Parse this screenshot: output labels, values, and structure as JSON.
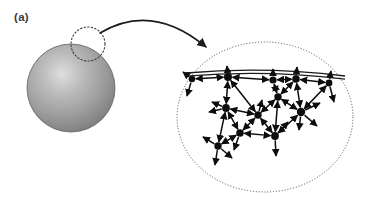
{
  "figure": {
    "panel_label": "(a)",
    "background_color": "#ffffff",
    "width": 369,
    "height": 202
  },
  "particle": {
    "name": "nanoparticle-sphere",
    "center_x": 71,
    "center_y": 88,
    "radius": 44,
    "highlight_x": 62,
    "highlight_y": 78,
    "color_center": "#d8d8d8",
    "color_mid": "#9a9a9a",
    "color_edge": "#6f6f6f",
    "outline_color": "#5e5e5e"
  },
  "callout_circle": {
    "name": "surface-region-marker",
    "center_x": 88,
    "center_y": 44,
    "radius": 17,
    "stroke_color": "#3b3b3b",
    "dash": "1.4 2.2"
  },
  "callout_arrow": {
    "name": "magnification-arrow",
    "start_x": 100,
    "start_y": 33,
    "control_x": 152,
    "control_y": 2,
    "end_x": 206,
    "end_y": 47,
    "stroke_color": "#1b1b1b",
    "stroke_width": 1.6
  },
  "magnified_view": {
    "name": "magnified-surface-ellipse",
    "center_x": 265,
    "center_y": 117,
    "radius_x": 88,
    "radius_y": 75,
    "stroke_color": "#4a4a4a",
    "dash": "1 1.9"
  },
  "surface_line": {
    "name": "crystal-surface-line",
    "x1": 186,
    "y1": 73,
    "cx": 265,
    "cy": 66,
    "x2": 345,
    "y2": 76,
    "stroke_color": "#1b1b1b",
    "stroke_width": 1.3,
    "offset": 3.2
  },
  "network": {
    "name": "atomic-interaction-network",
    "node_color": "#0d0d0d",
    "edge_color": "#0d0d0d",
    "edge_width": 1.5,
    "node_radius_default": 3.4,
    "nodes": [
      {
        "id": "n0",
        "x": 192,
        "y": 79,
        "r": 3.3
      },
      {
        "id": "n1",
        "x": 228,
        "y": 77,
        "r": 4.0
      },
      {
        "id": "n2",
        "x": 273,
        "y": 80,
        "r": 3.6
      },
      {
        "id": "n3",
        "x": 296,
        "y": 79,
        "r": 3.8
      },
      {
        "id": "n4",
        "x": 329,
        "y": 83,
        "r": 3.4
      },
      {
        "id": "n5",
        "x": 226,
        "y": 108,
        "r": 3.9
      },
      {
        "id": "n6",
        "x": 258,
        "y": 115,
        "r": 3.7
      },
      {
        "id": "n7",
        "x": 278,
        "y": 97,
        "r": 3.7
      },
      {
        "id": "n8",
        "x": 301,
        "y": 112,
        "r": 4.2
      },
      {
        "id": "n9",
        "x": 240,
        "y": 133,
        "r": 3.8
      },
      {
        "id": "n10",
        "x": 275,
        "y": 136,
        "r": 3.9
      },
      {
        "id": "n11",
        "x": 218,
        "y": 146,
        "r": 3.7
      }
    ],
    "edges": [
      {
        "from": "n0",
        "to": "n1"
      },
      {
        "from": "n1",
        "to": "n2"
      },
      {
        "from": "n2",
        "to": "n3"
      },
      {
        "from": "n3",
        "to": "n4"
      },
      {
        "from": "n1",
        "to": "n5"
      },
      {
        "from": "n1",
        "to": "n6"
      },
      {
        "from": "n2",
        "to": "n7"
      },
      {
        "from": "n3",
        "to": "n7"
      },
      {
        "from": "n3",
        "to": "n8"
      },
      {
        "from": "n4",
        "to": "n8"
      },
      {
        "from": "n5",
        "to": "n6"
      },
      {
        "from": "n6",
        "to": "n7"
      },
      {
        "from": "n7",
        "to": "n8"
      },
      {
        "from": "n5",
        "to": "n9"
      },
      {
        "from": "n6",
        "to": "n9"
      },
      {
        "from": "n6",
        "to": "n10"
      },
      {
        "from": "n8",
        "to": "n10"
      },
      {
        "from": "n7",
        "to": "n10"
      },
      {
        "from": "n9",
        "to": "n10"
      },
      {
        "from": "n9",
        "to": "n11"
      },
      {
        "from": "n5",
        "to": "n11"
      }
    ],
    "stubs": [
      {
        "from": "n0",
        "dx": -5,
        "dy": 17
      },
      {
        "from": "n0",
        "dx": -9,
        "dy": -7
      },
      {
        "from": "n1",
        "dx": -1,
        "dy": -11
      },
      {
        "from": "n2",
        "dx": 0,
        "dy": -11
      },
      {
        "from": "n3",
        "dx": 1,
        "dy": -12
      },
      {
        "from": "n4",
        "dx": 2,
        "dy": -12
      },
      {
        "from": "n4",
        "dx": 5,
        "dy": 19
      },
      {
        "from": "n5",
        "dx": -17,
        "dy": 4
      },
      {
        "from": "n5",
        "dx": -14,
        "dy": -6
      },
      {
        "from": "n8",
        "dx": 19,
        "dy": -9
      },
      {
        "from": "n8",
        "dx": 16,
        "dy": 14
      },
      {
        "from": "n8",
        "dx": -2,
        "dy": 18
      },
      {
        "from": "n9",
        "dx": -6,
        "dy": 17
      },
      {
        "from": "n10",
        "dx": 1,
        "dy": 20
      },
      {
        "from": "n10",
        "dx": 13,
        "dy": -14
      },
      {
        "from": "n11",
        "dx": -15,
        "dy": -9
      },
      {
        "from": "n11",
        "dx": -3,
        "dy": 19
      },
      {
        "from": "n11",
        "dx": 14,
        "dy": 12
      },
      {
        "from": "n6",
        "dx": 4,
        "dy": -15
      }
    ]
  }
}
